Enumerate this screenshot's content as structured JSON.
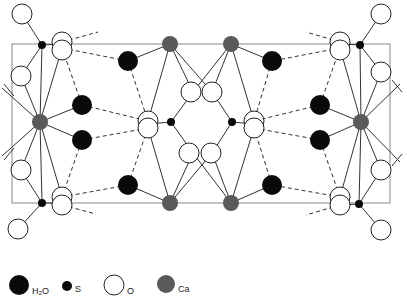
{
  "diagram": {
    "colors": {
      "h2o": "#0a0a0a",
      "s": "#0a0a0a",
      "o_fill": "#ffffff",
      "o_stroke": "#222222",
      "ca": "#5a5a5a",
      "bond": "#333333",
      "cell": "#777777"
    },
    "unit_cell": {
      "x": 12,
      "y": 44,
      "width": 378,
      "height": 159
    },
    "atoms": {
      "ca": [
        [
          40,
          122
        ],
        [
          361,
          122
        ],
        [
          170,
          44
        ],
        [
          231,
          44
        ],
        [
          170,
          203
        ],
        [
          231,
          203
        ]
      ],
      "s": [
        [
          42,
          45
        ],
        [
          42,
          203
        ],
        [
          360,
          45
        ],
        [
          359,
          204
        ],
        [
          171,
          122
        ],
        [
          232,
          122
        ]
      ],
      "h2o": [
        [
          128,
          61
        ],
        [
          82,
          105
        ],
        [
          82,
          140
        ],
        [
          128,
          185
        ],
        [
          272,
          61
        ],
        [
          320,
          105
        ],
        [
          320,
          140
        ],
        [
          272,
          185
        ]
      ],
      "o": [
        [
          22,
          14
        ],
        [
          21,
          76
        ],
        [
          21,
          170
        ],
        [
          18,
          229
        ],
        [
          62,
          42
        ],
        [
          62,
          50
        ],
        [
          62,
          197
        ],
        [
          62,
          205
        ],
        [
          148,
          121
        ],
        [
          148,
          128
        ],
        [
          254,
          121
        ],
        [
          254,
          128
        ],
        [
          193,
          92
        ],
        [
          212,
          92
        ],
        [
          193,
          153
        ],
        [
          212,
          153
        ],
        [
          340,
          42
        ],
        [
          340,
          50
        ],
        [
          340,
          197
        ],
        [
          340,
          205
        ],
        [
          381,
          14
        ],
        [
          381,
          72
        ],
        [
          381,
          170
        ],
        [
          381,
          230
        ]
      ]
    }
  },
  "legend": {
    "items": [
      {
        "symbol": "h2o",
        "label": "H₂O"
      },
      {
        "symbol": "s",
        "label": "S"
      },
      {
        "symbol": "o",
        "label": "O"
      },
      {
        "symbol": "ca",
        "label": "Ca"
      }
    ]
  }
}
